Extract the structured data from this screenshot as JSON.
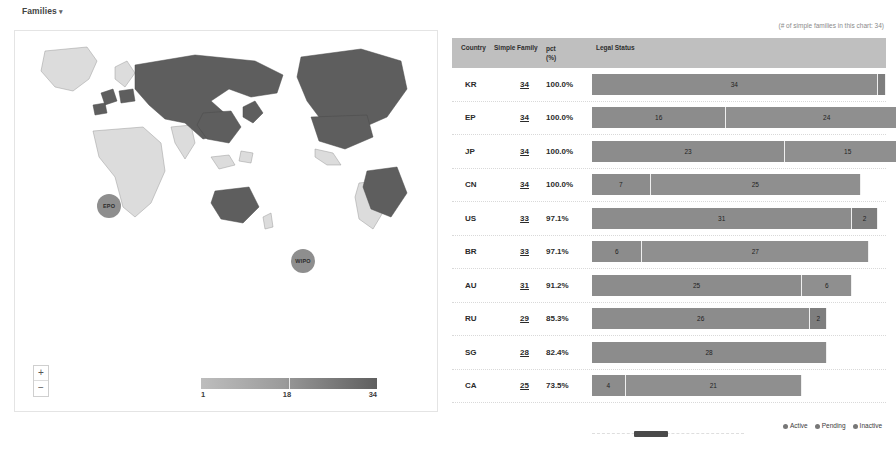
{
  "header": {
    "title": "Families",
    "caret": "▾",
    "note": "(# of simple families in this chart: 34)"
  },
  "map": {
    "bubbles": [
      {
        "label": "EPO"
      },
      {
        "label": "WIPO"
      }
    ],
    "zoom_in": "+",
    "zoom_out": "−",
    "scale": {
      "min": "1",
      "mid": "18",
      "max": "34"
    }
  },
  "table": {
    "columns": {
      "country": "Country",
      "family": "Simple Family",
      "pct": "pct",
      "pct_unit": "(%)",
      "legal": "Legal Status"
    },
    "rows": [
      {
        "country": "KR",
        "family": "34",
        "pct": "100.0%",
        "segments": [
          {
            "label": "34",
            "value": 34,
            "status": "active"
          },
          {
            "label": "",
            "value": 1,
            "status": "inactive"
          }
        ]
      },
      {
        "country": "EP",
        "family": "34",
        "pct": "100.0%",
        "segments": [
          {
            "label": "16",
            "value": 16,
            "status": "active"
          },
          {
            "label": "24",
            "value": 24,
            "status": "pending"
          }
        ]
      },
      {
        "country": "JP",
        "family": "34",
        "pct": "100.0%",
        "segments": [
          {
            "label": "23",
            "value": 23,
            "status": "active"
          },
          {
            "label": "15",
            "value": 15,
            "status": "pending"
          }
        ]
      },
      {
        "country": "CN",
        "family": "34",
        "pct": "100.0%",
        "segments": [
          {
            "label": "7",
            "value": 7,
            "status": "active"
          },
          {
            "label": "25",
            "value": 25,
            "status": "pending"
          }
        ]
      },
      {
        "country": "US",
        "family": "33",
        "pct": "97.1%",
        "segments": [
          {
            "label": "31",
            "value": 31,
            "status": "active"
          },
          {
            "label": "2",
            "value": 3,
            "status": "inactive"
          }
        ]
      },
      {
        "country": "BR",
        "family": "33",
        "pct": "97.1%",
        "segments": [
          {
            "label": "6",
            "value": 6,
            "status": "active"
          },
          {
            "label": "27",
            "value": 27,
            "status": "pending"
          }
        ]
      },
      {
        "country": "AU",
        "family": "31",
        "pct": "91.2%",
        "segments": [
          {
            "label": "25",
            "value": 25,
            "status": "active"
          },
          {
            "label": "6",
            "value": 6,
            "status": "pending"
          }
        ]
      },
      {
        "country": "RU",
        "family": "29",
        "pct": "85.3%",
        "segments": [
          {
            "label": "26",
            "value": 26,
            "status": "active"
          },
          {
            "label": "2",
            "value": 2,
            "status": "inactive"
          }
        ]
      },
      {
        "country": "SG",
        "family": "28",
        "pct": "82.4%",
        "segments": [
          {
            "label": "28",
            "value": 28,
            "status": "active"
          }
        ]
      },
      {
        "country": "CA",
        "family": "25",
        "pct": "73.5%",
        "segments": [
          {
            "label": "4",
            "value": 4,
            "status": "active"
          },
          {
            "label": "21",
            "value": 21,
            "status": "pending"
          }
        ]
      }
    ]
  },
  "legend": [
    {
      "label": "Active"
    },
    {
      "label": "Pending"
    },
    {
      "label": "Inactive"
    }
  ],
  "chart_data": {
    "type": "bar",
    "orientation": "horizontal",
    "stacked": true,
    "categories": [
      "KR",
      "EP",
      "JP",
      "CN",
      "US",
      "BR",
      "AU",
      "RU",
      "SG",
      "CA"
    ],
    "simple_family": [
      34,
      34,
      34,
      34,
      33,
      33,
      31,
      29,
      28,
      25
    ],
    "pct": [
      100.0,
      100.0,
      100.0,
      100.0,
      97.1,
      97.1,
      91.2,
      85.3,
      82.4,
      73.5
    ],
    "series": [
      {
        "name": "Active",
        "values": [
          34,
          16,
          23,
          7,
          31,
          6,
          25,
          26,
          28,
          4
        ]
      },
      {
        "name": "Pending",
        "values": [
          0,
          24,
          15,
          25,
          0,
          27,
          6,
          0,
          0,
          21
        ]
      },
      {
        "name": "Inactive",
        "values": [
          1,
          0,
          0,
          0,
          2,
          0,
          0,
          2,
          0,
          0
        ]
      }
    ],
    "xlabel": "Legal Status",
    "ylabel": "Country",
    "legend_position": "bottom-right",
    "total_simple_families": 34,
    "map_scale": {
      "min": 1,
      "mid": 18,
      "max": 34,
      "unit": "families"
    }
  }
}
